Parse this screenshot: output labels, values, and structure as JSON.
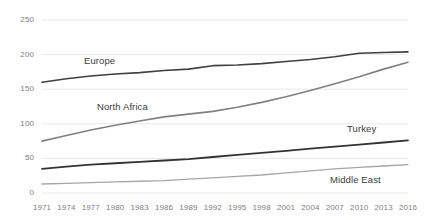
{
  "chart_data": {
    "type": "line",
    "title": "",
    "xlabel": "",
    "ylabel": "",
    "xlim": [
      1971,
      2016
    ],
    "ylim": [
      0,
      250
    ],
    "grid": true,
    "legend_position": "inline-labels",
    "y_ticks": [
      0,
      50,
      100,
      150,
      200,
      250
    ],
    "x_ticks": [
      1971,
      1974,
      1977,
      1980,
      1983,
      1986,
      1989,
      1992,
      1995,
      1998,
      2001,
      2004,
      2007,
      2010,
      2013,
      2016
    ],
    "x": [
      1971,
      1974,
      1977,
      1980,
      1983,
      1986,
      1989,
      1992,
      1995,
      1998,
      2001,
      2004,
      2007,
      2010,
      2013,
      2016
    ],
    "series": [
      {
        "name": "Europe",
        "color": "#404040",
        "width": 1.6,
        "values": [
          160,
          165,
          169,
          172,
          174,
          177,
          179,
          184,
          185,
          187,
          190,
          193,
          197,
          202,
          203,
          204
        ]
      },
      {
        "name": "North Africa",
        "color": "#808080",
        "width": 1.6,
        "values": [
          75,
          83,
          91,
          98,
          104,
          110,
          114,
          118,
          124,
          131,
          139,
          148,
          158,
          168,
          179,
          189
        ]
      },
      {
        "name": "Turkey",
        "color": "#333333",
        "width": 1.8,
        "values": [
          35,
          38,
          41,
          43,
          45,
          47,
          49,
          52,
          55,
          58,
          61,
          64,
          67,
          70,
          73,
          76
        ]
      },
      {
        "name": "Middle East",
        "color": "#a6a6a6",
        "width": 1.3,
        "values": [
          13,
          14,
          15,
          16,
          17,
          18,
          20,
          22,
          24,
          26,
          29,
          32,
          35,
          37,
          39,
          41
        ]
      }
    ],
    "annotations": [
      {
        "text": "Europe",
        "x_px": 84,
        "y_px": 55
      },
      {
        "text": "North Africa",
        "x_px": 97,
        "y_px": 101
      },
      {
        "text": "Turkey",
        "x_px": 347,
        "y_px": 123
      },
      {
        "text": "Middle East",
        "x_px": 330,
        "y_px": 174
      }
    ]
  }
}
